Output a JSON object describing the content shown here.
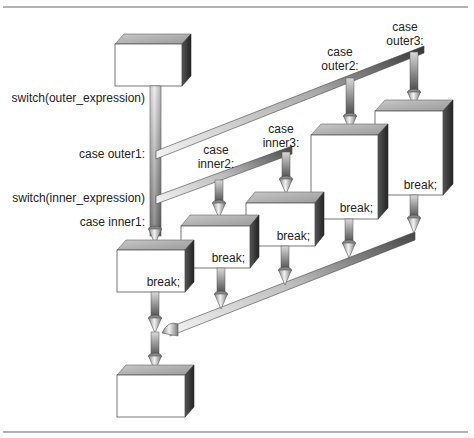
{
  "diagram": {
    "colors": {
      "box_top": "#b0b0b0",
      "box_side": "#2e2e2e",
      "pipe_light": "#e8e8e8",
      "pipe_dark": "#3a3a3a",
      "rule": "#666666",
      "text": "#222222"
    },
    "left_labels": {
      "switch_outer": "switch(outer_expression)",
      "case_outer1": "case outer1:",
      "switch_inner": "switch(inner_expression)",
      "case_inner1": "case inner1:"
    },
    "case_labels": {
      "outer2": {
        "line1": "case",
        "line2": "outer2:"
      },
      "outer3": {
        "line1": "case",
        "line2": "outer3:"
      },
      "inner2": {
        "line1": "case",
        "line2": "inner2:"
      },
      "inner3": {
        "line1": "case",
        "line2": "inner3:"
      }
    },
    "boxes": [
      {
        "id": "start",
        "label": ""
      },
      {
        "id": "inner1",
        "label": "break;"
      },
      {
        "id": "inner2",
        "label": "break;"
      },
      {
        "id": "inner3",
        "label": "break;"
      },
      {
        "id": "outer2",
        "label": "break;"
      },
      {
        "id": "outer3",
        "label": "break;"
      },
      {
        "id": "end",
        "label": ""
      }
    ]
  }
}
